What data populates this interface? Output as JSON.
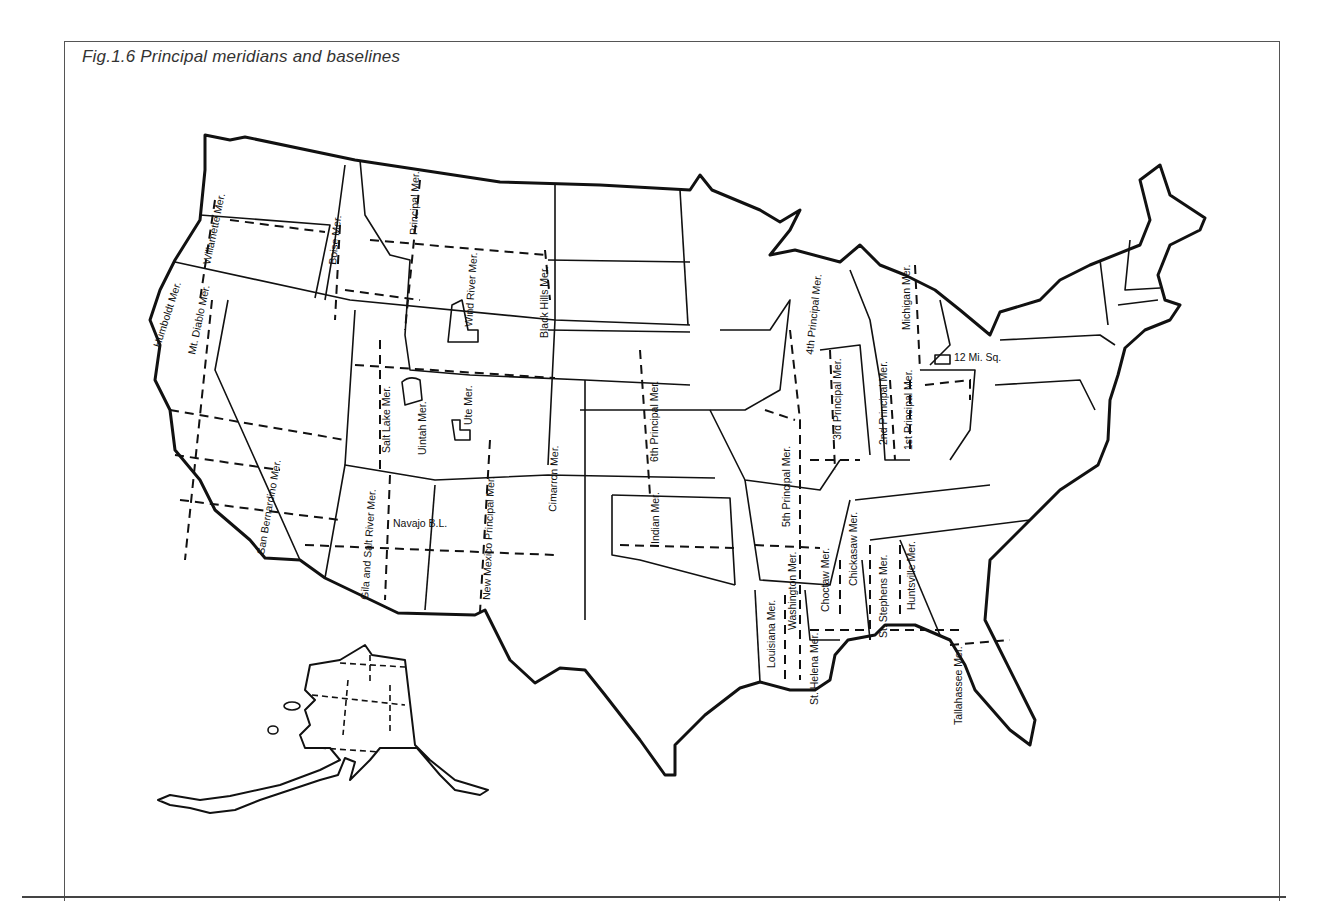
{
  "figure": {
    "title": "Fig.1.6  Principal meridians and baselines"
  },
  "meridians": [
    {
      "label": "Humboldt Mer.",
      "x": 160,
      "y": 348,
      "rot": -72
    },
    {
      "label": "Willamette Mer.",
      "x": 210,
      "y": 265,
      "rot": -78
    },
    {
      "label": "Mt. Diablo Mer.",
      "x": 195,
      "y": 355,
      "rot": -78
    },
    {
      "label": "Boise Mer.",
      "x": 336,
      "y": 265,
      "rot": -84
    },
    {
      "label": "Principal Mer.",
      "x": 417,
      "y": 235,
      "rot": -88
    },
    {
      "label": "Wind River Mer.",
      "x": 472,
      "y": 327,
      "rot": -86
    },
    {
      "label": "Black Hills Mer.",
      "x": 548,
      "y": 338,
      "rot": -90
    },
    {
      "label": "Salt Lake Mer.",
      "x": 390,
      "y": 453,
      "rot": -90
    },
    {
      "label": "Uintah Mer.",
      "x": 426,
      "y": 455,
      "rot": -90
    },
    {
      "label": "Ute Mer.",
      "x": 472,
      "y": 425,
      "rot": -90
    },
    {
      "label": "San Bernardino Mer.",
      "x": 264,
      "y": 555,
      "rot": -80
    },
    {
      "label": "Gila and Salt River Mer.",
      "x": 368,
      "y": 600,
      "rot": -86
    },
    {
      "label": "Navajo B.L.",
      "x": 393,
      "y": 527,
      "rot": 0
    },
    {
      "label": "New Mexico Principal Mer.",
      "x": 490,
      "y": 600,
      "rot": -88
    },
    {
      "label": "Cimarron Mer.",
      "x": 556,
      "y": 512,
      "rot": -88
    },
    {
      "label": "6th Principal Mer.",
      "x": 658,
      "y": 462,
      "rot": -90
    },
    {
      "label": "Indian Mer.",
      "x": 659,
      "y": 544,
      "rot": -90
    },
    {
      "label": "5th Principal Mer.",
      "x": 790,
      "y": 527,
      "rot": -90
    },
    {
      "label": "4th Principal Mer.",
      "x": 813,
      "y": 355,
      "rot": -84
    },
    {
      "label": "3rd Principal Mer.",
      "x": 841,
      "y": 440,
      "rot": -90
    },
    {
      "label": "Michigan Mer.",
      "x": 910,
      "y": 330,
      "rot": -90
    },
    {
      "label": "2nd Principal Mer.",
      "x": 887,
      "y": 445,
      "rot": -90
    },
    {
      "label": "1st Principal Mer.",
      "x": 912,
      "y": 450,
      "rot": -90
    },
    {
      "label": "12 Mi. Sq.",
      "x": 954,
      "y": 361,
      "rot": 0
    },
    {
      "label": "Washington Mer.",
      "x": 796,
      "y": 630,
      "rot": -90
    },
    {
      "label": "Choctaw Mer.",
      "x": 829,
      "y": 612,
      "rot": -90
    },
    {
      "label": "Chickasaw Mer.",
      "x": 857,
      "y": 586,
      "rot": -90
    },
    {
      "label": "St. Stephens Mer.",
      "x": 887,
      "y": 638,
      "rot": -90
    },
    {
      "label": "Huntsville Mer.",
      "x": 915,
      "y": 610,
      "rot": -90
    },
    {
      "label": "Louisiana Mer.",
      "x": 775,
      "y": 668,
      "rot": -90
    },
    {
      "label": "St. Helena Mer.",
      "x": 818,
      "y": 705,
      "rot": -90
    },
    {
      "label": "Tallahassee Mer.",
      "x": 962,
      "y": 725,
      "rot": -90
    }
  ]
}
